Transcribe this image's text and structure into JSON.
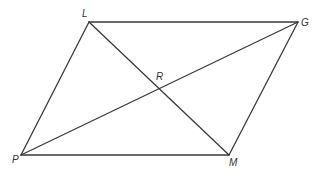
{
  "diagram": {
    "type": "parallelogram-with-diagonals",
    "colors": {
      "line": "#3a3a3a",
      "label": "#333333",
      "background": "#ffffff"
    },
    "points": {
      "L": {
        "label": "L",
        "x": 89,
        "y": 22,
        "label_x": 82,
        "label_y": 17
      },
      "G": {
        "label": "G",
        "x": 298,
        "y": 22,
        "label_x": 301,
        "label_y": 26
      },
      "P": {
        "label": "P",
        "x": 21,
        "y": 155,
        "label_x": 12,
        "label_y": 163
      },
      "M": {
        "label": "M",
        "x": 229,
        "y": 155,
        "label_x": 229,
        "label_y": 166
      },
      "R": {
        "label": "R",
        "x": 159,
        "y": 89,
        "label_x": 156,
        "label_y": 80
      }
    },
    "segments": [
      {
        "name": "side-LG",
        "from": "L",
        "to": "G"
      },
      {
        "name": "side-GM",
        "from": "G",
        "to": "M"
      },
      {
        "name": "side-MP",
        "from": "M",
        "to": "P"
      },
      {
        "name": "side-PL",
        "from": "P",
        "to": "L"
      },
      {
        "name": "diagonal-LM",
        "from": "L",
        "to": "M"
      },
      {
        "name": "diagonal-PG",
        "from": "P",
        "to": "G"
      }
    ]
  }
}
